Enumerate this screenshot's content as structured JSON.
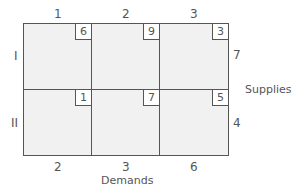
{
  "diagram": {
    "columns": [
      "1",
      "2",
      "3"
    ],
    "rows": [
      "I",
      "II"
    ],
    "costs": [
      [
        "6",
        "9",
        "3"
      ],
      [
        "1",
        "7",
        "5"
      ]
    ],
    "supplies": [
      "7",
      "4"
    ],
    "demands": [
      "2",
      "3",
      "6"
    ],
    "supplies_label": "Supplies",
    "demands_label": "Demands"
  }
}
